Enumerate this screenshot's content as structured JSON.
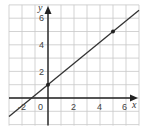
{
  "chart_data": {
    "type": "line",
    "title": "",
    "xlabel": "x",
    "ylabel": "y",
    "xlim": [
      -3,
      7
    ],
    "ylim": [
      -2,
      7
    ],
    "grid": true,
    "x_tick_labels": [
      "-2",
      "0",
      "2",
      "4",
      "6"
    ],
    "y_tick_labels": [
      "2",
      "4",
      "6"
    ],
    "series": [
      {
        "name": "line",
        "equation": "y = 0.8x + 1",
        "slope": 0.8,
        "intercept": 1,
        "x": [
          -3,
          7
        ],
        "y": [
          -1.4,
          6.6
        ]
      }
    ],
    "points": [
      {
        "x": 0,
        "y": 1
      },
      {
        "x": 5,
        "y": 5
      }
    ]
  },
  "labels": {
    "x_axis": "x",
    "y_axis": "y",
    "origin": "0",
    "xt_m2": "-2",
    "xt_2": "2",
    "xt_4": "4",
    "xt_6": "6",
    "yt_2": "2",
    "yt_4": "4",
    "yt_6": "6"
  },
  "colors": {
    "grid": "#c8c8c8",
    "axis": "#222222",
    "line": "#333333",
    "point": "#222222"
  }
}
